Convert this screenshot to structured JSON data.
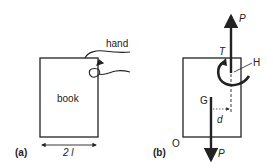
{
  "figure_a": {
    "panel_label": "(a)",
    "book_label": "book",
    "hand_label": "hand",
    "width_label": "2 l"
  },
  "figure_b": {
    "panel_label": "(b)",
    "force_top_label": "P",
    "force_bottom_label": "P",
    "torque_label": "T",
    "hand_point_label": "H",
    "center_label": "G",
    "distance_label": "d",
    "origin_label": "O"
  },
  "colors": {
    "stroke": "#222222",
    "background": "#ffffff"
  }
}
